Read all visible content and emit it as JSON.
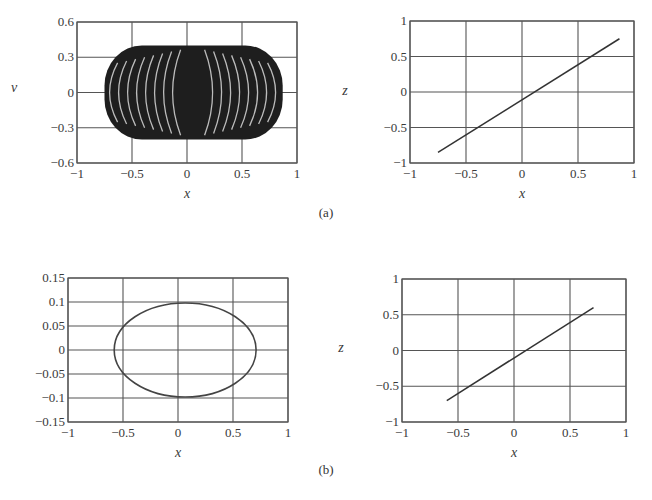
{
  "figure": {
    "panel_labels": [
      "(a)",
      "(b)"
    ]
  },
  "chart_data": [
    {
      "id": "a-left",
      "panel": "(a)",
      "type": "scatter",
      "title": "",
      "xlabel": "x",
      "ylabel": "v",
      "xlim": [
        -1,
        1
      ],
      "ylim": [
        -0.6,
        0.6
      ],
      "xticks": [
        -1,
        -0.5,
        0,
        0.5,
        1
      ],
      "xtick_labels": [
        "−1",
        "−0.5",
        "0",
        "0.5",
        "1"
      ],
      "yticks": [
        -0.6,
        -0.3,
        0,
        0.3,
        0.6
      ],
      "ytick_labels": [
        "−0.6",
        "−0.3",
        "0",
        "0.3",
        "0.6"
      ],
      "grid": true,
      "description": "Dense torus-like point cloud (quasi-periodic orbit) filling region x∈[-0.75,0.87], v∈[-0.4,0.4] with white arc-shaped gaps",
      "region": {
        "x_min": -0.75,
        "x_max": 0.87,
        "y_min": -0.4,
        "y_max": 0.4,
        "center_x": 0.06
      }
    },
    {
      "id": "a-right",
      "panel": "(a)",
      "type": "line",
      "xlabel": "x",
      "ylabel": "z",
      "xlim": [
        -1,
        1
      ],
      "ylim": [
        -1,
        1
      ],
      "xticks": [
        -1,
        -0.5,
        0,
        0.5,
        1
      ],
      "xtick_labels": [
        "−1",
        "−0.5",
        "0",
        "0.5",
        "1"
      ],
      "yticks": [
        -1,
        -0.5,
        0,
        0.5,
        1
      ],
      "ytick_labels": [
        "−1",
        "−0.5",
        "0",
        "0.5",
        "1"
      ],
      "grid": true,
      "series": [
        {
          "name": "z vs x",
          "x": [
            -0.75,
            0.87
          ],
          "y": [
            -0.85,
            0.75
          ]
        }
      ]
    },
    {
      "id": "b-left",
      "panel": "(b)",
      "type": "line",
      "xlabel": "x",
      "ylabel": "",
      "xlim": [
        -1,
        1
      ],
      "ylim": [
        -0.15,
        0.15
      ],
      "xticks": [
        -1,
        -0.5,
        0,
        0.5,
        1
      ],
      "xtick_labels": [
        "−1",
        "−0.5",
        "0",
        "0.5",
        "1"
      ],
      "yticks": [
        -0.15,
        -0.1,
        -0.05,
        0,
        0.05,
        0.1,
        0.15
      ],
      "ytick_labels": [
        "−0.15",
        "−0.1",
        "−0.05",
        "0",
        "0.05",
        "0.1",
        "0.15"
      ],
      "grid": true,
      "description": "Closed ellipse (periodic orbit)",
      "ellipse": {
        "cx": 0.065,
        "cy": 0,
        "rx": 0.645,
        "ry": 0.098
      }
    },
    {
      "id": "b-right",
      "panel": "(b)",
      "type": "line",
      "xlabel": "x",
      "ylabel": "z",
      "xlim": [
        -1,
        1
      ],
      "ylim": [
        -1,
        1
      ],
      "xticks": [
        -1,
        -0.5,
        0,
        0.5,
        1
      ],
      "xtick_labels": [
        "−1",
        "−0.5",
        "0",
        "0.5",
        "1"
      ],
      "yticks": [
        -1,
        -0.5,
        0,
        0.5,
        1
      ],
      "ytick_labels": [
        "−1",
        "−0.5",
        "0",
        "0.5",
        "1"
      ],
      "grid": true,
      "series": [
        {
          "name": "z vs x",
          "x": [
            -0.6,
            0.71
          ],
          "y": [
            -0.7,
            0.6
          ]
        }
      ]
    }
  ]
}
